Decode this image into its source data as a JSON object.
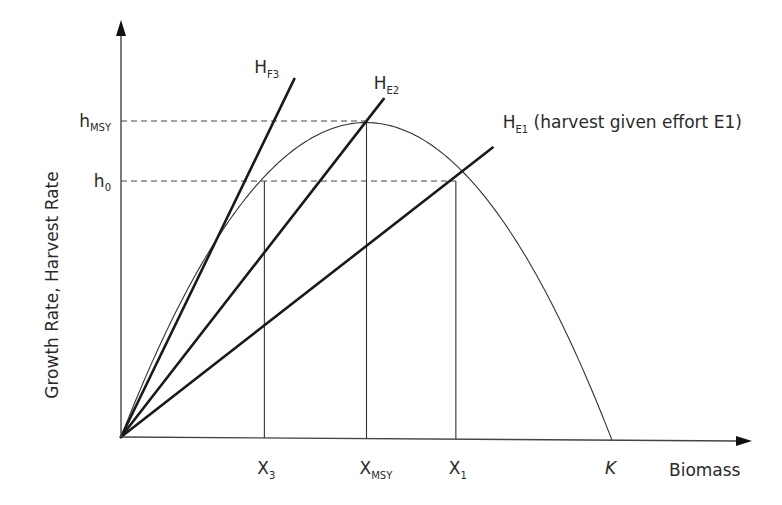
{
  "chart_data": {
    "type": "line",
    "title": "",
    "xlabel": "Biomass",
    "ylabel": "Growth Rate, Harvest Rate",
    "xlim": [
      0,
      1.27
    ],
    "ylim": [
      0,
      1.33
    ],
    "grid": false,
    "legend": "none",
    "growth_curve": {
      "name": "growth",
      "form": "logistic",
      "K": 1.0,
      "h_msy": 1.0,
      "x_msy": 0.5
    },
    "series": [
      {
        "name": "H_E2",
        "label_main": "H",
        "label_sub": "E2",
        "label_rest": "",
        "slope": 2.0,
        "x_end": 0.535
      },
      {
        "name": "H_F3",
        "label_main": "H",
        "label_sub": "F3",
        "label_rest": "",
        "slope": 3.21,
        "x_end": 0.353
      },
      {
        "name": "H_E1",
        "label_main": "H",
        "label_sub": "E1",
        "label_rest": " (harvest given effort E1)",
        "slope": 1.21,
        "x_end": 0.757
      }
    ],
    "y_ticks": [
      {
        "main": "h",
        "sub": "MSY",
        "value": 1.0
      },
      {
        "main": "h",
        "sub": "0",
        "value": 0.81
      }
    ],
    "x_ticks": [
      {
        "main": "X",
        "sub": "3",
        "value": 0.292,
        "italic": false
      },
      {
        "main": "X",
        "sub": "MSY",
        "value": 0.5,
        "italic": false
      },
      {
        "main": "X",
        "sub": "1",
        "value": 0.682,
        "italic": false
      },
      {
        "main": "K",
        "sub": "",
        "value": 1.0,
        "italic": true
      }
    ],
    "reference_lines": [
      {
        "type": "dashed-horizontal",
        "from_tick": "h_MSY",
        "to_x": 0.5
      },
      {
        "type": "dashed-horizontal",
        "from_tick": "h_0",
        "to_x": 0.682
      },
      {
        "type": "vertical",
        "at_x": 0.292,
        "to_y": 0.81
      },
      {
        "type": "vertical",
        "at_x": 0.5,
        "to_y": 1.0
      },
      {
        "type": "vertical",
        "at_x": 0.682,
        "to_y": 0.81
      }
    ]
  }
}
